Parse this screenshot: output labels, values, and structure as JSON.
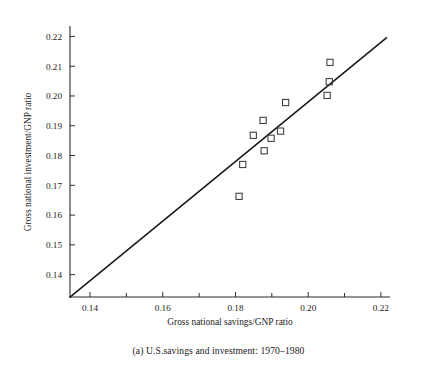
{
  "caption": "(a) U.S.savings and investment: 1970–1980",
  "chart_data": {
    "type": "scatter",
    "title": "",
    "xlabel": "Gross national savings/GNP ratio",
    "ylabel": "Gross national investment/GNP ratio",
    "xlim": [
      0.1345,
      0.2225
    ],
    "ylim": [
      0.1325,
      0.2235
    ],
    "xticks": [
      0.14,
      0.16,
      0.18,
      0.2,
      0.22
    ],
    "xticklabels": [
      "0.14",
      "0.16",
      "0.18",
      "0.20",
      "0.22"
    ],
    "xminorticks": [
      0.15,
      0.17,
      0.19,
      0.21
    ],
    "yticks": [
      0.14,
      0.15,
      0.16,
      0.17,
      0.18,
      0.19,
      0.2,
      0.21,
      0.22
    ],
    "yticklabels": [
      "0.14",
      "0.15",
      "0.16",
      "0.17",
      "0.18",
      "0.19",
      "0.20",
      "0.21",
      "0.22"
    ],
    "grid": false,
    "legend": false,
    "marker": "open-square",
    "marker_color": "#3a3a3a",
    "line_color": "#1a1a1a",
    "points": [
      {
        "x": 0.181,
        "y": 0.1663
      },
      {
        "x": 0.182,
        "y": 0.177
      },
      {
        "x": 0.1849,
        "y": 0.1868
      },
      {
        "x": 0.1876,
        "y": 0.1918
      },
      {
        "x": 0.1879,
        "y": 0.1816
      },
      {
        "x": 0.1898,
        "y": 0.1858
      },
      {
        "x": 0.1924,
        "y": 0.1882
      },
      {
        "x": 0.1938,
        "y": 0.1978
      },
      {
        "x": 0.2052,
        "y": 0.2002
      },
      {
        "x": 0.2058,
        "y": 0.2048
      },
      {
        "x": 0.206,
        "y": 0.2113
      }
    ],
    "reference_line": {
      "description": "45-degree line",
      "x0": 0.1345,
      "y0": 0.1325,
      "x1": 0.2215,
      "y1": 0.2195
    }
  }
}
